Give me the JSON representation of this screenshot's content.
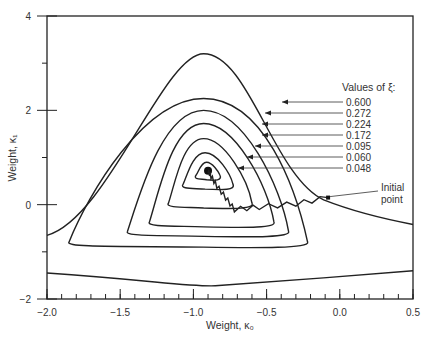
{
  "chart_data": {
    "type": "line",
    "title": "",
    "xlabel": "Weight, κ₀",
    "ylabel": "Weight, κ₁",
    "xlim": [
      -2.0,
      0.5
    ],
    "ylim": [
      -2,
      4
    ],
    "x_ticks": [
      -2.0,
      -1.5,
      -1.0,
      -0.5,
      0.0,
      0.5
    ],
    "x_tick_labels": [
      "−2.0",
      "−1.5",
      "−1.0",
      "−0.5",
      "0.0",
      "0.5"
    ],
    "y_ticks": [
      -2,
      0,
      2,
      4
    ],
    "y_tick_labels": [
      "−2",
      "0",
      "2",
      "4"
    ],
    "grid": false,
    "legend_title": "Values of ξ:",
    "legend_position": "top-right",
    "center": [
      -0.9,
      0.72
    ],
    "series": [
      {
        "name": "0.600",
        "xi": 0.6,
        "peak": [
          -0.93,
          3.2
        ]
      },
      {
        "name": "0.272",
        "xi": 0.272,
        "peak": [
          -0.93,
          2.25
        ]
      },
      {
        "name": "0.224",
        "xi": 0.224,
        "peak": [
          -0.93,
          2.0
        ]
      },
      {
        "name": "0.172",
        "xi": 0.172,
        "peak": [
          -0.93,
          1.72
        ]
      },
      {
        "name": "0.095",
        "xi": 0.095,
        "peak": [
          -0.93,
          1.4
        ]
      },
      {
        "name": "0.060",
        "xi": 0.06,
        "peak": [
          -0.92,
          1.1
        ]
      },
      {
        "name": "0.048",
        "xi": 0.048,
        "peak": [
          -0.91,
          0.9
        ]
      }
    ],
    "trajectory": {
      "label": "Initial point",
      "points": [
        [
          -0.08,
          0.15
        ],
        [
          -0.3,
          0.02
        ],
        [
          -0.55,
          -0.05
        ],
        [
          -0.72,
          -0.1
        ],
        [
          -0.78,
          0.15
        ],
        [
          -0.84,
          0.4
        ],
        [
          -0.88,
          0.6
        ],
        [
          -0.9,
          0.72
        ]
      ]
    }
  }
}
